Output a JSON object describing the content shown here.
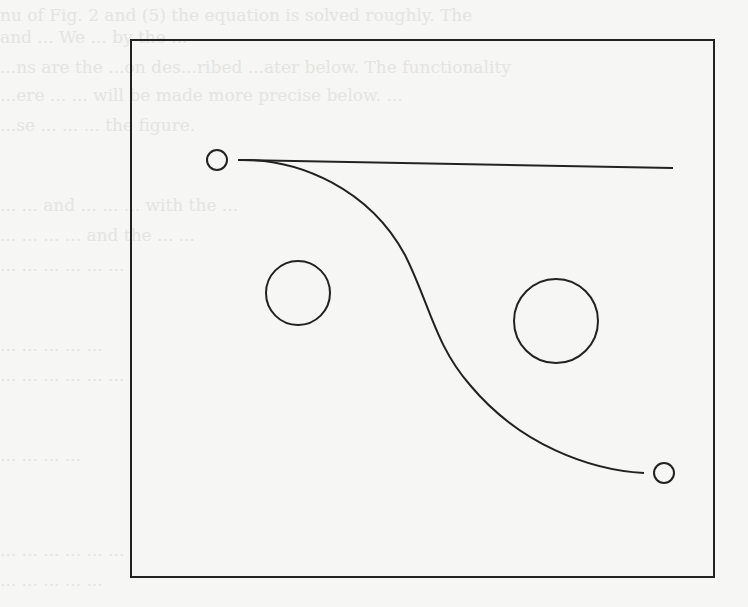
{
  "diagram": {
    "stroke_color": "#222222",
    "background_color": "#f6f6f4",
    "frame": {
      "x": 131,
      "y": 40,
      "width": 583,
      "height": 537
    },
    "start_point": {
      "cx": 217,
      "cy": 160,
      "r": 10
    },
    "goal_point": {
      "cx": 664,
      "cy": 473,
      "r": 10
    },
    "obstacles": [
      {
        "name": "left-obstacle",
        "cx": 298,
        "cy": 293,
        "r": 32
      },
      {
        "name": "right-obstacle",
        "cx": 556,
        "cy": 321,
        "r": 42
      }
    ],
    "straight_path": {
      "x1": 238,
      "y1": 160,
      "x2": 673,
      "y2": 168
    },
    "curved_path": "M 238 160 C 300 158, 370 190, 405 255 C 430 305, 435 345, 470 385 C 520 445, 590 470, 644 473"
  },
  "bleed_through_text": [
    "nu of Fig. 2 and (5) the equation is solved roughly. The",
    "and  ...  We ...  by the ...",
    "...ns  are the ...on des...ribed ...ater below. The functionality",
    "...ere  ...  ...  will be made more precise below. ...",
    "...se ...  ...  ...  the figure.",
    "...  ...  and ...  ...  ...  with the ...",
    "...  ...  ...  ...  and the ...  ...",
    "...  ...  ...  ...  ...  ...",
    "...  ...  ...  ...  ...",
    "...  ...  ...  ...  ...  ...",
    "...  ...  ...  ...",
    "...  ...  ...  ...  ...  ...",
    "...  ...  ...  ...  ..."
  ]
}
